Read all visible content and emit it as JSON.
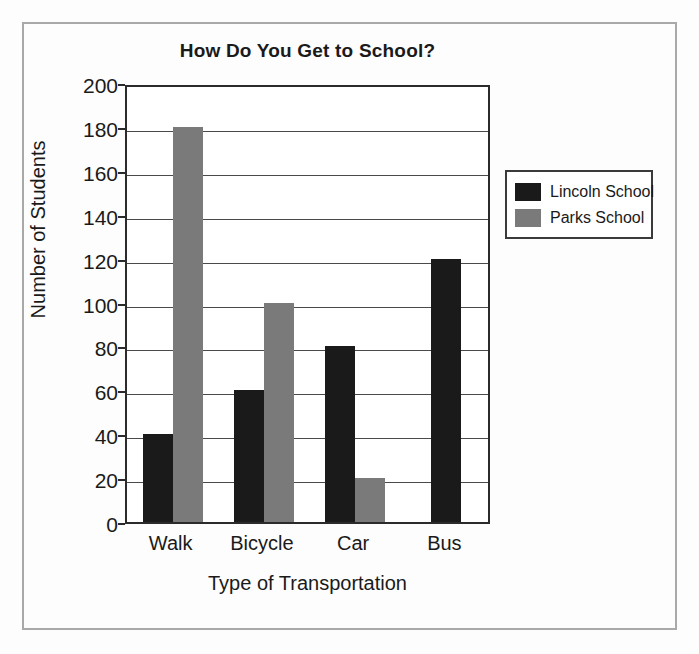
{
  "figure": {
    "background_color": "#fdfdfd",
    "frame_color": "#a9a9a9"
  },
  "chart_data": {
    "type": "bar",
    "title": "How Do You Get to School?",
    "xlabel": "Type of Transportation",
    "ylabel": "Number of Students",
    "categories": [
      "Walk",
      "Bicycle",
      "Car",
      "Bus"
    ],
    "series": [
      {
        "name": "Lincoln School",
        "color": "#1a1a1a",
        "values": [
          40,
          60,
          80,
          120
        ]
      },
      {
        "name": "Parks School",
        "color": "#7a7a7a",
        "values": [
          180,
          100,
          20,
          0
        ]
      }
    ],
    "ylim": [
      0,
      200
    ],
    "yticks": [
      0,
      20,
      40,
      60,
      80,
      100,
      120,
      140,
      160,
      180,
      200
    ],
    "ytick_labels": [
      "0",
      "20",
      "40",
      "60",
      "80",
      "100",
      "120",
      "140",
      "160",
      "180",
      "200"
    ],
    "grid": true,
    "grid_axis": "y",
    "legend_position": "right-outside"
  },
  "legend": {
    "entries": [
      {
        "label": "Lincoln School",
        "color": "#1a1a1a"
      },
      {
        "label": "Parks School",
        "color": "#7a7a7a"
      }
    ]
  }
}
